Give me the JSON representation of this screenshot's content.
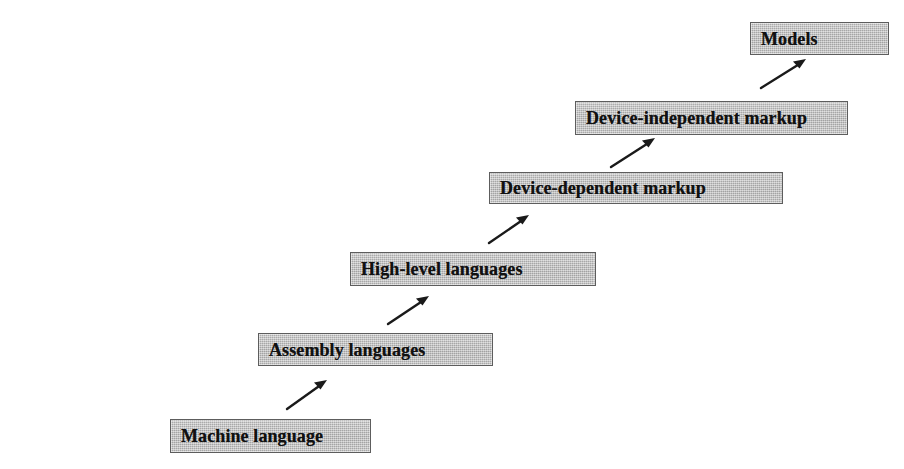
{
  "diagram": {
    "type": "staircase-flow",
    "background_color": "#ffffff",
    "box_fill_color": "#b9b9b9",
    "box_border_color": "#5d5d5d",
    "text_color": "#111111",
    "arrow_color": "#1a1a1a",
    "steps": [
      {
        "id": "machine-language",
        "label": "Machine language",
        "level": 1
      },
      {
        "id": "assembly-languages",
        "label": "Assembly languages",
        "level": 2
      },
      {
        "id": "high-level",
        "label": "High-level languages",
        "level": 3
      },
      {
        "id": "device-dependent",
        "label": "Device-dependent markup",
        "level": 4
      },
      {
        "id": "device-independent",
        "label": "Device-independent markup",
        "level": 5
      },
      {
        "id": "models",
        "label": "Models",
        "level": 6
      }
    ],
    "connectors": [
      {
        "from": "machine-language",
        "to": "assembly-languages",
        "style": "arrow-up-right"
      },
      {
        "from": "assembly-languages",
        "to": "high-level",
        "style": "arrow-up-right"
      },
      {
        "from": "high-level",
        "to": "device-dependent",
        "style": "arrow-up-right"
      },
      {
        "from": "device-dependent",
        "to": "device-independent",
        "style": "arrow-up-right"
      },
      {
        "from": "device-independent",
        "to": "models",
        "style": "arrow-up-right"
      }
    ]
  }
}
